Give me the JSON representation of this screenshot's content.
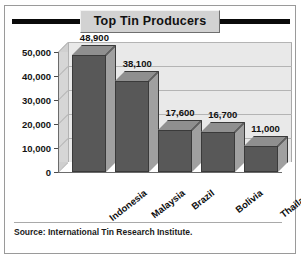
{
  "card": {
    "source_note": "Source: International Tin Research Institute."
  },
  "chart_data": {
    "type": "bar",
    "title": "Top Tin Producers",
    "xlabel": "",
    "ylabel": "Metric Tons",
    "categories": [
      "Indonesia",
      "Malaysia",
      "Brazil",
      "Bolivia",
      "Thailand"
    ],
    "values": [
      48900,
      38100,
      17600,
      16700,
      11000
    ],
    "value_labels": [
      "48,900",
      "38,100",
      "17,600",
      "16,700",
      "11,000"
    ],
    "ylim": [
      0,
      50000
    ],
    "ytick_values": [
      0,
      10000,
      20000,
      30000,
      40000,
      50000
    ],
    "ytick_labels": [
      "0",
      "10,000",
      "20,000",
      "30,000",
      "40,000",
      "50,000"
    ],
    "grid": true,
    "legend": false,
    "series": [
      {
        "name": "Tin production",
        "values": [
          48900,
          38100,
          17600,
          16700,
          11000
        ]
      }
    ],
    "colors": {
      "bar_front": "#585858",
      "bar_top": "#8f8f8f",
      "bar_side": "#a0a0a0",
      "plot_background": "#e9e9e9",
      "gridline": "#b4b4b4",
      "title_bar": "#0a0a0a",
      "title_box": "#d2d2d2",
      "card_background": "#ffffff"
    }
  }
}
